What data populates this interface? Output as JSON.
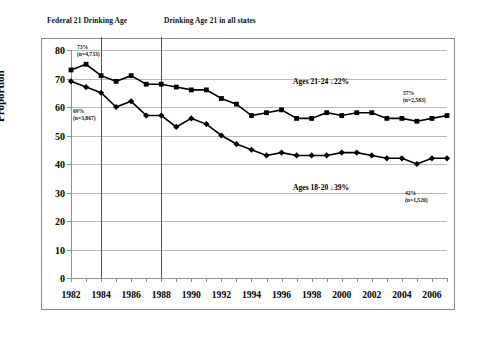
{
  "figure": {
    "y_axis_title": "Proportion",
    "annotations": {
      "federal_line": "Federal 21 Drinking Age",
      "all_states_line": "Drinking Age 21 in all states"
    },
    "callouts": [
      {
        "name": "start-21-24",
        "pct": "73%",
        "n": "(n=4,733)"
      },
      {
        "name": "start-18-20",
        "pct": "69%",
        "n": "(n=3,867)"
      },
      {
        "name": "end-21-24",
        "pct": "57%",
        "n": "(n=2,583)"
      },
      {
        "name": "end-18-20",
        "pct": "42%",
        "n": "(n=1,520)"
      }
    ],
    "series_labels": [
      {
        "name": "ages-21-24",
        "text": "Ages 21-24  ↓22%"
      },
      {
        "name": "ages-18-20",
        "text": "Ages 18-20  ↓39%"
      }
    ],
    "colors": {
      "series": "#000000",
      "grid": "#b9b9b9",
      "axis": "#8f8f8f",
      "frame": "#8a8a8a",
      "reference_line": "#555555"
    }
  },
  "chart_data": {
    "type": "line",
    "title": "",
    "xlabel": "",
    "ylabel": "Proportion",
    "ylim": [
      0,
      80
    ],
    "xlim": [
      1982,
      2007
    ],
    "yticks": [
      0,
      10,
      20,
      30,
      40,
      50,
      60,
      70,
      80
    ],
    "grid": true,
    "legend": "inline-annotation",
    "x": [
      1982,
      1983,
      1984,
      1985,
      1986,
      1987,
      1988,
      1989,
      1990,
      1991,
      1992,
      1993,
      1994,
      1995,
      1996,
      1997,
      1998,
      1999,
      2000,
      2001,
      2002,
      2003,
      2004,
      2005,
      2006,
      2007
    ],
    "xticklabels": [
      "1982",
      "",
      "1984",
      "",
      "1986",
      "",
      "1988",
      "",
      "1990",
      "",
      "1992",
      "",
      "1994",
      "",
      "1996",
      "",
      "1998",
      "",
      "2000",
      "",
      "2002",
      "",
      "2004",
      "",
      "2006",
      ""
    ],
    "series": [
      {
        "name": "Ages 21-24",
        "marker": "square",
        "change_label": "↓22%",
        "values": [
          73,
          75,
          71,
          69,
          71,
          68,
          68,
          67,
          66,
          66,
          63,
          61,
          57,
          58,
          59,
          56,
          56,
          58,
          57,
          58,
          58,
          56,
          56,
          55,
          56,
          57
        ]
      },
      {
        "name": "Ages 18-20",
        "marker": "diamond",
        "change_label": "↓39%",
        "values": [
          69,
          67,
          65,
          60,
          62,
          57,
          57,
          53,
          56,
          54,
          50,
          47,
          45,
          43,
          44,
          43,
          43,
          43,
          44,
          44,
          43,
          42,
          42,
          40,
          42,
          42
        ]
      }
    ],
    "reference_lines": [
      {
        "x": 1984,
        "label": "Federal 21 Drinking Age"
      },
      {
        "x": 1988,
        "label": "Drinking Age 21 in all states"
      }
    ],
    "endpoint_annotations": [
      {
        "series": "Ages 21-24",
        "position": "start",
        "value": 73,
        "n": 4733,
        "text": "73% (n=4,733)"
      },
      {
        "series": "Ages 18-20",
        "position": "start",
        "value": 69,
        "n": 3867,
        "text": "69% (n=3,867)"
      },
      {
        "series": "Ages 21-24",
        "position": "end",
        "value": 57,
        "n": 2583,
        "text": "57% (n=2,583)"
      },
      {
        "series": "Ages 18-20",
        "position": "end",
        "value": 42,
        "n": 1520,
        "text": "42% (n=1,520)"
      }
    ]
  }
}
